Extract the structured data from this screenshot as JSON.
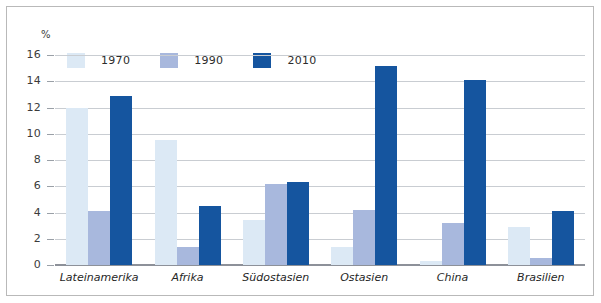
{
  "chart_data": {
    "type": "bar",
    "title": "",
    "xlabel": "",
    "ylabel": "%",
    "unit_label": "%",
    "ylim": [
      0,
      16
    ],
    "yticks": [
      0,
      2,
      4,
      6,
      8,
      10,
      12,
      14,
      16
    ],
    "ytick_labels": [
      "0",
      "2",
      "4",
      "6",
      "8",
      "10",
      "12",
      "14",
      "16"
    ],
    "grid": true,
    "legend_position": "top-left-inside",
    "categories": [
      "Lateinamerika",
      "Afrika",
      "Südostasien",
      "Ostasien",
      "China",
      "Brasilien"
    ],
    "series": [
      {
        "name": "1970",
        "color": "#dce9f5",
        "values": [
          12.0,
          9.5,
          3.4,
          1.4,
          0.3,
          2.9
        ]
      },
      {
        "name": "1990",
        "color": "#a8b8dd",
        "values": [
          4.1,
          1.4,
          6.2,
          4.2,
          3.2,
          0.5
        ]
      },
      {
        "name": "2010",
        "color": "#15559f",
        "values": [
          12.9,
          4.5,
          6.35,
          15.2,
          14.1,
          4.1
        ]
      }
    ]
  },
  "colors": {
    "series_1970": "#dce9f5",
    "series_1990": "#a8b8dd",
    "series_2010": "#15559f",
    "gridline": "#c9cdd2",
    "axis": "#8d9199",
    "frame_border": "#b9b9b9",
    "text": "#262626",
    "background": "#ffffff"
  }
}
